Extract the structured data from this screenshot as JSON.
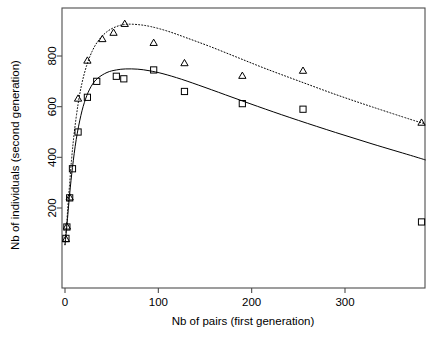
{
  "figure": {
    "background_color": "#ffffff",
    "foreground_color": "#000000",
    "width": 446,
    "height": 339
  },
  "axes": {
    "x_title": "Nb of pairs (first generation)",
    "y_title": "Nb of individuals (second generation)",
    "x_ticks": [
      "0",
      "100",
      "200",
      "300"
    ],
    "y_ticks": [
      "200",
      "400",
      "600",
      "800"
    ]
  },
  "chart_data": {
    "type": "scatter",
    "title": "",
    "xlabel": "Nb of pairs (first generation)",
    "ylabel": "Nb of individuals (second generation)",
    "xlim": [
      -13,
      387
    ],
    "ylim": [
      55,
      980
    ],
    "x_ticks": [
      0,
      100,
      200,
      300
    ],
    "y_ticks": [
      200,
      400,
      600,
      800
    ],
    "grid": false,
    "legend": "none",
    "box": "full",
    "series": [
      {
        "name": "Squares (observed, group 1)",
        "marker": "square",
        "marker_color": "#000000",
        "marker_fill": "none",
        "points": [
          {
            "x": 1,
            "y": 80
          },
          {
            "x": 2,
            "y": 125
          },
          {
            "x": 5,
            "y": 240
          },
          {
            "x": 8,
            "y": 355
          },
          {
            "x": 14,
            "y": 500
          },
          {
            "x": 24,
            "y": 637
          },
          {
            "x": 34,
            "y": 700
          },
          {
            "x": 55,
            "y": 720
          },
          {
            "x": 63,
            "y": 710
          },
          {
            "x": 95,
            "y": 745
          },
          {
            "x": 128,
            "y": 660
          },
          {
            "x": 190,
            "y": 612
          },
          {
            "x": 255,
            "y": 590
          },
          {
            "x": 382,
            "y": 145
          }
        ]
      },
      {
        "name": "Triangles (observed, group 2)",
        "marker": "triangle",
        "marker_color": "#000000",
        "marker_fill": "none",
        "points": [
          {
            "x": 1,
            "y": 75
          },
          {
            "x": 2,
            "y": 125
          },
          {
            "x": 5,
            "y": 240
          },
          {
            "x": 14,
            "y": 630
          },
          {
            "x": 24,
            "y": 780
          },
          {
            "x": 40,
            "y": 865
          },
          {
            "x": 52,
            "y": 890
          },
          {
            "x": 64,
            "y": 925
          },
          {
            "x": 95,
            "y": 850
          },
          {
            "x": 128,
            "y": 770
          },
          {
            "x": 190,
            "y": 720
          },
          {
            "x": 255,
            "y": 740
          },
          {
            "x": 382,
            "y": 535
          }
        ]
      }
    ],
    "curves": [
      {
        "name": "Fitted Ricker curve (solid, group 1)",
        "line_style": "solid",
        "line_color": "#000000",
        "line_width": 1,
        "points": [
          {
            "x": 0,
            "y": 55
          },
          {
            "x": 2,
            "y": 130
          },
          {
            "x": 5,
            "y": 255
          },
          {
            "x": 8,
            "y": 360
          },
          {
            "x": 12,
            "y": 470
          },
          {
            "x": 17,
            "y": 565
          },
          {
            "x": 22,
            "y": 630
          },
          {
            "x": 28,
            "y": 680
          },
          {
            "x": 35,
            "y": 712
          },
          {
            "x": 45,
            "y": 735
          },
          {
            "x": 55,
            "y": 745
          },
          {
            "x": 65,
            "y": 749
          },
          {
            "x": 78,
            "y": 748
          },
          {
            "x": 90,
            "y": 742
          },
          {
            "x": 105,
            "y": 730
          },
          {
            "x": 125,
            "y": 708
          },
          {
            "x": 150,
            "y": 676
          },
          {
            "x": 180,
            "y": 636
          },
          {
            "x": 215,
            "y": 590
          },
          {
            "x": 250,
            "y": 546
          },
          {
            "x": 290,
            "y": 498
          },
          {
            "x": 330,
            "y": 452
          },
          {
            "x": 370,
            "y": 408
          },
          {
            "x": 386,
            "y": 390
          }
        ]
      },
      {
        "name": "Fitted Ricker curve (dotted, group 2)",
        "line_style": "dotted",
        "line_color": "#000000",
        "line_width": 1,
        "points": [
          {
            "x": 0,
            "y": 55
          },
          {
            "x": 2,
            "y": 150
          },
          {
            "x": 4,
            "y": 250
          },
          {
            "x": 7,
            "y": 390
          },
          {
            "x": 10,
            "y": 500
          },
          {
            "x": 14,
            "y": 610
          },
          {
            "x": 18,
            "y": 690
          },
          {
            "x": 23,
            "y": 760
          },
          {
            "x": 29,
            "y": 818
          },
          {
            "x": 36,
            "y": 862
          },
          {
            "x": 45,
            "y": 896
          },
          {
            "x": 55,
            "y": 916
          },
          {
            "x": 65,
            "y": 925
          },
          {
            "x": 78,
            "y": 924
          },
          {
            "x": 92,
            "y": 916
          },
          {
            "x": 110,
            "y": 898
          },
          {
            "x": 130,
            "y": 872
          },
          {
            "x": 155,
            "y": 838
          },
          {
            "x": 185,
            "y": 794
          },
          {
            "x": 215,
            "y": 750
          },
          {
            "x": 250,
            "y": 702
          },
          {
            "x": 290,
            "y": 648
          },
          {
            "x": 330,
            "y": 598
          },
          {
            "x": 370,
            "y": 550
          },
          {
            "x": 386,
            "y": 532
          }
        ]
      }
    ]
  }
}
